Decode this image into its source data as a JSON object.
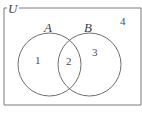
{
  "figure": {
    "type": "venn-diagram",
    "sets": 2,
    "universe_label": "U",
    "set_labels": [
      "A",
      "B"
    ],
    "region_labels": [
      "1",
      "2",
      "3",
      "4"
    ],
    "region_meaning": [
      "A only",
      "A and B",
      "B only",
      "outside both sets (universe only)"
    ],
    "stroke_color": "#6e6e6e",
    "text_color": "#3d3d3d",
    "background_color": "#ffffff"
  },
  "labels": {
    "universe": "U",
    "set_a": "A",
    "set_b": "B",
    "region_1": "1",
    "region_2": "2",
    "region_3": "3",
    "region_4": "4"
  }
}
